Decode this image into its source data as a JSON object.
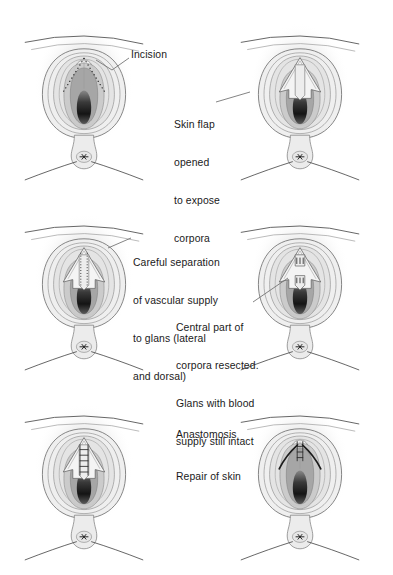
{
  "figure": {
    "kind": "medical-surgical-illustration",
    "panel_count": 6,
    "grid": "2 columns x 3 rows",
    "colors": {
      "background": "#ffffff",
      "outline": "#5b5b5b",
      "outline_dark": "#3d3d3d",
      "skin_light": "#efefef",
      "skin_mid": "#dcdcdc",
      "corpora_mid": "#c2c2c2",
      "corpora_dark": "#9a9a9a",
      "introitus_black": "#1a1a1a",
      "text": "#1a1a1a",
      "leader_line": "#6e6e6e",
      "suture": "#2a2a2a"
    }
  },
  "panels": [
    {
      "id": "panel-1",
      "position": "top-left",
      "stage": "incision",
      "features": [
        "dotted incision line",
        "intact skin",
        "perineum",
        "anus"
      ]
    },
    {
      "id": "panel-2",
      "position": "top-right",
      "stage": "skin-flap-opened",
      "features": [
        "V-shaped skin flap retracted",
        "corpora exposed"
      ]
    },
    {
      "id": "panel-3",
      "position": "middle-left",
      "stage": "vascular-separation",
      "features": [
        "flap opened wide",
        "dotted dissection plane",
        "vascular pedicle preserved"
      ]
    },
    {
      "id": "panel-4",
      "position": "middle-right",
      "stage": "corpora-resected",
      "features": [
        "central corpora segment removed",
        "stumps marked",
        "glans on pedicle"
      ]
    },
    {
      "id": "panel-5",
      "position": "bottom-left",
      "stage": "anastomosis",
      "features": [
        "suture ladder joining glans to stump"
      ]
    },
    {
      "id": "panel-6",
      "position": "bottom-right",
      "stage": "skin-repair",
      "features": [
        "curved suture arcs",
        "vertical closure line",
        "skin re-approximated"
      ]
    }
  ],
  "labels": [
    {
      "id": "label-incision",
      "text": "Incision",
      "lines": [
        "Incision"
      ],
      "points_to": "panel-1",
      "has_leader_line": true
    },
    {
      "id": "label-skin-flap",
      "text": "Skin flap opened to expose corpora",
      "lines": [
        "Skin flap",
        "opened",
        "to expose",
        "corpora"
      ],
      "points_to": "panel-2",
      "has_leader_line": true
    },
    {
      "id": "label-vascular-separation",
      "text": "Careful separation of vascular supply to glans (lateral and dorsal)",
      "lines": [
        "Careful separation",
        "of vascular supply",
        "to glans (lateral",
        "and dorsal)"
      ],
      "points_to": "panel-3",
      "has_leader_line": true
    },
    {
      "id": "label-corpora-resected",
      "text": "Central part of corpora resected. Glans with blood supply still intact",
      "lines": [
        "Central part of",
        "corpora resected.",
        "Glans with blood",
        "supply still intact"
      ],
      "points_to": "panel-4",
      "has_leader_line": true
    },
    {
      "id": "label-anastomosis",
      "text": "Anastomosis",
      "lines": [
        "Anastomosis"
      ],
      "points_to": "panel-5",
      "has_leader_line": false
    },
    {
      "id": "label-repair-of-skin",
      "text": "Repair of skin",
      "lines": [
        "Repair of skin"
      ],
      "points_to": "panel-6",
      "has_leader_line": false
    }
  ]
}
